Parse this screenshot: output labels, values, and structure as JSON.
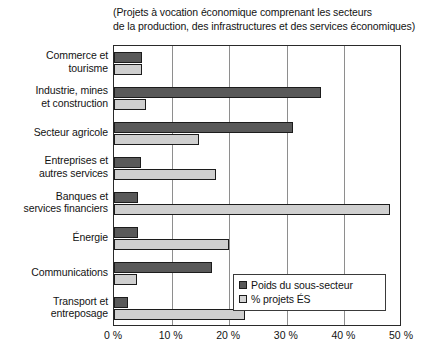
{
  "caption": {
    "line1": "(Projets à vocation économique comprenant les secteurs",
    "line2": "de la production, des infrastructures et des services économiques)"
  },
  "legend": {
    "items": [
      {
        "label": "Poids du sous-secteur",
        "swatch": "dark-swatch-icon",
        "color": "#595959"
      },
      {
        "label": "% projets ÉS",
        "swatch": "light-swatch-icon",
        "color": "#d4d4d4"
      }
    ]
  },
  "axis": {
    "x_ticks": [
      "0 %",
      "10 %",
      "20 %",
      "30 %",
      "40 %",
      "50 %"
    ],
    "x_tick_values": [
      0,
      10,
      20,
      30,
      40,
      50
    ]
  },
  "chart_data": {
    "type": "bar",
    "orientation": "horizontal",
    "title": "",
    "subtitle": "(Projets à vocation économique comprenant les secteurs de la production, des infrastructures et des services économiques)",
    "xlabel": "",
    "ylabel": "",
    "xlim": [
      0,
      50
    ],
    "x_unit": "%",
    "grid": true,
    "grid_axis": "x",
    "legend_position": "bottom-right",
    "categories": [
      "Commerce et tourisme",
      "Industrie, mines et construction",
      "Secteur agricole",
      "Entreprises et autres services",
      "Banques et services financiers",
      "Énergie",
      "Communications",
      "Transport et entreposage"
    ],
    "category_lines": [
      [
        "Commerce et",
        "tourisme"
      ],
      [
        "Industrie, mines",
        "et construction"
      ],
      [
        "Secteur agricole"
      ],
      [
        "Entreprises et",
        "autres services"
      ],
      [
        "Banques et",
        "services financiers"
      ],
      [
        "Énergie"
      ],
      [
        "Communications"
      ],
      [
        "Transport et",
        "entreposage"
      ]
    ],
    "series": [
      {
        "name": "Poids du sous-secteur",
        "color": "#595959",
        "values": [
          4.8,
          35.9,
          31.0,
          4.7,
          4.1,
          4.1,
          17.0,
          2.4
        ]
      },
      {
        "name": "% projets ÉS",
        "color": "#cfcfcf",
        "values": [
          4.8,
          5.5,
          14.8,
          17.7,
          48.0,
          20.0,
          4.0,
          22.7
        ]
      }
    ]
  }
}
